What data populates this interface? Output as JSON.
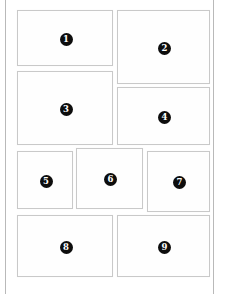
{
  "page": {
    "background_color": "#ffffff",
    "sheet_border_color": "#b9b9b9",
    "panel_border_color": "#c9c9c9",
    "badge_color": "#0d0d0d",
    "badge_text_color": "#ffffff"
  },
  "caption": {
    "text": "",
    "note": "clipped caption row at bottom edge"
  },
  "panels": [
    {
      "label": "1",
      "name": "panel-1",
      "x": 16,
      "y": 10,
      "w": 96,
      "h": 56
    },
    {
      "label": "2",
      "name": "panel-2",
      "x": 116,
      "y": 10,
      "w": 93,
      "h": 74
    },
    {
      "label": "3",
      "name": "panel-3",
      "x": 16,
      "y": 71,
      "w": 96,
      "h": 74
    },
    {
      "label": "4",
      "name": "panel-4",
      "x": 116,
      "y": 87,
      "w": 93,
      "h": 58
    },
    {
      "label": "5",
      "name": "panel-5",
      "x": 16,
      "y": 151,
      "w": 56,
      "h": 58
    },
    {
      "label": "6",
      "name": "panel-6",
      "x": 75,
      "y": 148,
      "w": 67,
      "h": 61
    },
    {
      "label": "7",
      "name": "panel-7",
      "x": 146,
      "y": 151,
      "w": 63,
      "h": 61
    },
    {
      "label": "8",
      "name": "panel-8",
      "x": 16,
      "y": 215,
      "w": 96,
      "h": 62
    },
    {
      "label": "9",
      "name": "panel-9",
      "x": 116,
      "y": 215,
      "w": 93,
      "h": 62
    }
  ]
}
